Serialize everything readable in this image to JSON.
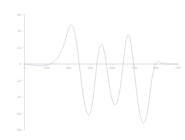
{
  "chart_data": {
    "type": "line",
    "title": "",
    "xlabel": "",
    "ylabel": "",
    "xlim": [
      0,
      700
    ],
    "ylim": [
      -80,
      60
    ],
    "grid": false,
    "legend": null,
    "line_color": "#c6cbd6",
    "axis_color": "#cfcfd4",
    "tick_label_color": "#b9b9bd",
    "xticks": [
      0,
      100,
      200,
      300,
      400,
      500,
      600,
      700
    ],
    "xtick_labels": [
      "0",
      "100",
      "200",
      "300",
      "400",
      "500",
      "600",
      "700"
    ],
    "yticks": [
      -80,
      -60,
      -40,
      -20,
      0,
      20,
      40,
      60
    ],
    "ytick_labels": [
      "-80",
      "-60",
      "-40",
      "-20",
      "0",
      "20",
      "40",
      "60"
    ],
    "series": [
      {
        "name": "signal",
        "x": [
          0,
          10,
          20,
          30,
          40,
          50,
          60,
          70,
          80,
          90,
          100,
          110,
          120,
          130,
          140,
          150,
          160,
          170,
          180,
          190,
          200,
          205,
          210,
          215,
          220,
          225,
          230,
          235,
          240,
          245,
          250,
          255,
          260,
          265,
          270,
          275,
          280,
          285,
          290,
          295,
          300,
          305,
          310,
          315,
          320,
          325,
          330,
          335,
          340,
          345,
          350,
          355,
          360,
          365,
          370,
          375,
          380,
          385,
          390,
          395,
          400,
          405,
          410,
          415,
          420,
          425,
          430,
          435,
          440,
          445,
          450,
          455,
          460,
          465,
          470,
          475,
          480,
          485,
          490,
          495,
          500,
          505,
          510,
          515,
          520,
          525,
          530,
          535,
          540,
          545,
          550,
          555,
          560,
          565,
          570,
          575,
          580,
          585,
          590,
          595,
          600,
          605,
          610,
          615,
          620,
          630,
          640,
          650,
          660,
          670,
          680,
          690,
          700
        ],
        "y": [
          0,
          -0.4,
          -0.9,
          -1.3,
          -1.6,
          -1.8,
          -2.0,
          -2.1,
          -2.0,
          -1.8,
          -1.4,
          -0.7,
          0.4,
          1.9,
          4.0,
          7.0,
          11.0,
          16.5,
          23.5,
          32.0,
          41.0,
          44.8,
          46.9,
          47.3,
          46.0,
          42.8,
          37.5,
          30.2,
          21.0,
          10.5,
          -0.8,
          -12.0,
          -23.0,
          -33.0,
          -42.0,
          -49.5,
          -55.5,
          -59.5,
          -61.6,
          -61.5,
          -59.0,
          -54.0,
          -46.5,
          -36.5,
          -25.0,
          -12.5,
          0.5,
          10.0,
          17.5,
          22.0,
          24.0,
          23.2,
          19.5,
          13.5,
          5.5,
          -3.5,
          -13.0,
          -22.5,
          -31.0,
          -38.0,
          -43.5,
          -47.2,
          -49.2,
          -49.5,
          -48.0,
          -44.5,
          -39.0,
          -31.5,
          -22.0,
          -11.0,
          1.0,
          12.5,
          22.5,
          30.5,
          34.8,
          35.3,
          32.0,
          25.5,
          16.5,
          5.5,
          -6.5,
          -19.0,
          -31.0,
          -42.0,
          -51.5,
          -59.0,
          -65.0,
          -69.0,
          -71.3,
          -71.5,
          -69.5,
          -65.0,
          -58.5,
          -50.0,
          -40.5,
          -30.5,
          -20.5,
          -12.0,
          -5.5,
          -1.0,
          1.8,
          3.2,
          3.3,
          2.6,
          1.6,
          0.5,
          0.1,
          0.0,
          0.0,
          0.0,
          0.0,
          0.0,
          0.0
        ]
      }
    ]
  }
}
